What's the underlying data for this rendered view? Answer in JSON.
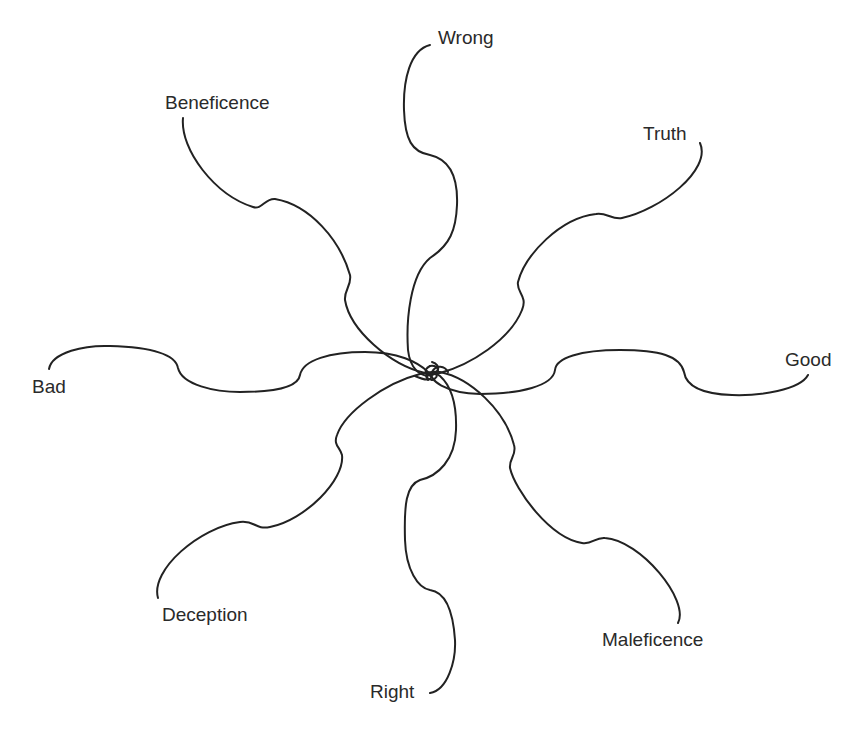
{
  "diagram": {
    "type": "radial-concept-map",
    "center": {
      "x": 430,
      "y": 372
    },
    "stroke_color": "#222222",
    "text_color": "#2a2a2a",
    "labels": [
      {
        "id": "wrong",
        "text": "Wrong",
        "x": 438,
        "y": 28
      },
      {
        "id": "beneficence",
        "text": "Beneficence",
        "x": 165,
        "y": 93
      },
      {
        "id": "truth",
        "text": "Truth",
        "x": 643,
        "y": 124
      },
      {
        "id": "good",
        "text": "Good",
        "x": 785,
        "y": 350
      },
      {
        "id": "bad",
        "text": "Bad",
        "x": 32,
        "y": 377
      },
      {
        "id": "deception",
        "text": "Deception",
        "x": 162,
        "y": 605
      },
      {
        "id": "maleficence",
        "text": "Maleficence",
        "x": 602,
        "y": 630
      },
      {
        "id": "right",
        "text": "Right",
        "x": 370,
        "y": 682
      }
    ],
    "arms": [
      {
        "id": "wrong",
        "d": "M430 45 C 410 50, 403 80, 404 110 C 405 140, 412 152, 430 155 C 452 160, 458 180, 457 205 C 456 230, 450 245, 430 258 C 410 275, 406 320, 408 350 C 410 368, 420 378, 432 375 C 442 372, 438 365, 430 366"
      },
      {
        "id": "beneficence",
        "d": "M183 118 C 180 150, 215 195, 253 207 C 262 210, 265 198, 275 199 C 310 205, 340 240, 350 275 C 352 285, 344 290, 345 300 C 350 330, 390 365, 425 373 C 440 376, 442 365, 432 362"
      },
      {
        "id": "truth",
        "d": "M700 143 C 712 170, 660 210, 622 218 C 612 220, 606 212, 596 214 C 560 218, 525 255, 518 282 C 516 292, 528 296, 522 310 C 510 340, 470 365, 440 373 C 425 377, 422 370, 430 366"
      },
      {
        "id": "good",
        "d": "M808 375 C 800 390, 760 396, 732 395 C 700 394, 686 385, 684 372 C 680 356, 660 350, 620 350 C 580 350, 556 358, 555 370 C 553 386, 520 394, 480 394 C 445 393, 428 380, 432 372 C 436 364, 445 366, 448 372"
      },
      {
        "id": "bad",
        "d": "M49 369 C 52 352, 85 345, 110 346 C 145 347, 175 352, 178 368 C 182 385, 215 392, 240 392 C 272 392, 298 388, 300 375 C 303 360, 330 352, 365 352 C 398 352, 418 362, 428 372 C 436 380, 428 382, 415 376"
      },
      {
        "id": "deception",
        "d": "M158 598 C 150 570, 200 527, 240 522 C 255 520, 255 530, 270 527 C 305 520, 345 480, 342 455 C 340 447, 333 445, 337 435 C 345 412, 385 383, 420 374 C 435 370, 442 376, 432 380"
      },
      {
        "id": "maleficence",
        "d": "M678 623 C 690 600, 640 540, 605 538 C 595 537, 592 545, 582 543 C 550 538, 515 490, 510 468 C 509 458, 517 455, 514 445 C 505 410, 470 378, 440 372 C 425 370, 422 378, 432 380"
      },
      {
        "id": "right",
        "d": "M430 693 C 448 690, 456 660, 455 640 C 453 610, 445 592, 430 590 C 418 588, 406 570, 405 540 C 404 505, 406 485, 420 480 C 438 476, 455 460, 456 430 C 457 400, 450 385, 440 376 C 432 370, 424 374, 428 380"
      }
    ]
  }
}
